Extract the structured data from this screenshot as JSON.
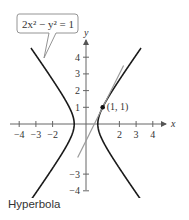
{
  "chart_data": {
    "type": "line",
    "title": "",
    "caption": "Hyperbola",
    "equation_label": "2x² − y² = 1",
    "xlabel": "x",
    "ylabel": "y",
    "xlim": [
      -4.5,
      4.5
    ],
    "ylim": [
      -4.5,
      4.5
    ],
    "xticks": [
      -4,
      -3,
      -2,
      2,
      3,
      4
    ],
    "xtick_labels": [
      "−4",
      "−3",
      "−2",
      "2",
      "3",
      "4"
    ],
    "yticks": [
      4,
      3,
      2,
      1,
      -3,
      -4
    ],
    "ytick_labels": [
      "4",
      "3",
      "2",
      "1",
      "−3",
      "−4"
    ],
    "grid": false,
    "series": [
      {
        "name": "hyperbola",
        "equation": "2x^2 - y^2 = 1",
        "color": "#1a1a1a"
      },
      {
        "name": "tangent line at (1, 1)",
        "equation": "y = 2x - 1",
        "color": "#999999",
        "x_range": [
          -0.5,
          2.25
        ]
      }
    ],
    "annotations": [
      {
        "type": "point",
        "x": 1,
        "y": 1,
        "label": "(1, 1)"
      }
    ]
  }
}
